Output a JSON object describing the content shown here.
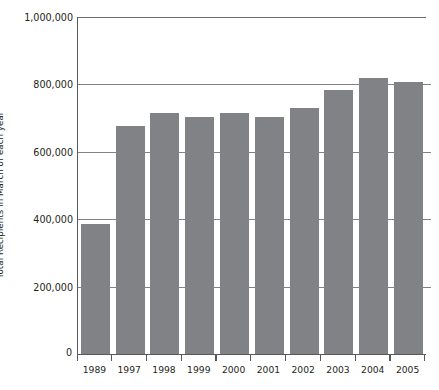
{
  "chart_data": {
    "type": "bar",
    "title": "",
    "subtitle": "",
    "xlabel": "",
    "ylabel": "Total Recipients in March of each year",
    "categories": [
      "1989",
      "1997",
      "1998",
      "1999",
      "2000",
      "2001",
      "2002",
      "2003",
      "2004",
      "2005"
    ],
    "values": [
      385000,
      677000,
      716000,
      703000,
      715000,
      703000,
      730000,
      784000,
      819000,
      807000
    ],
    "series": [
      {
        "name": "Total Recipients",
        "values": [
          385000,
          677000,
          716000,
          703000,
          715000,
          703000,
          730000,
          784000,
          819000,
          807000
        ]
      }
    ],
    "ylim": [
      0,
      1000000
    ],
    "ytick_values": [
      0,
      200000,
      400000,
      600000,
      800000,
      1000000
    ],
    "ytick_labels": [
      "0",
      "200,000",
      "400,000",
      "600,000",
      "800,000",
      "1,000,000"
    ],
    "grid": true,
    "grid_axis": "y",
    "legend": false,
    "legend_position": "none",
    "bar_color": "#808285",
    "axis_color": "#58595b",
    "grid_color": "#808285",
    "background_color": "#ffffff",
    "text_color": "#231f20"
  },
  "axes": {
    "y_title": "Total Recipients in March of each year",
    "zero_label": "0"
  }
}
